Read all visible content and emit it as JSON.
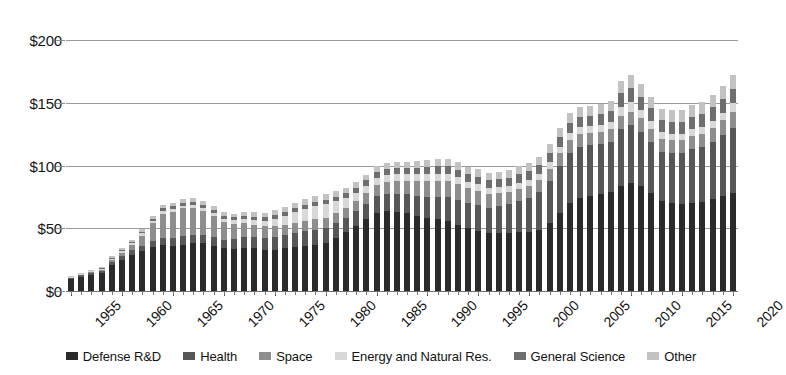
{
  "chart_data": {
    "type": "bar",
    "stacked": true,
    "title": "",
    "subtitle": "",
    "xlabel": "",
    "ylabel": "",
    "ylim": [
      0,
      200
    ],
    "y_ticks": [
      0,
      50,
      100,
      150,
      200
    ],
    "y_tick_labels": [
      "$0",
      "$50",
      "$100",
      "$150",
      "$200"
    ],
    "grid": true,
    "legend_position": "bottom",
    "x_tick_labels": [
      "1955",
      "1960",
      "1965",
      "1970",
      "1975",
      "1980",
      "1985",
      "1990",
      "1995",
      "2000",
      "2005",
      "2010",
      "2015",
      "2020"
    ],
    "categories": [
      "1955",
      "1956",
      "1957",
      "1958",
      "1959",
      "1960",
      "1961",
      "1962",
      "1963",
      "1964",
      "1965",
      "1966",
      "1967",
      "1968",
      "1969",
      "1970",
      "1971",
      "1972",
      "1973",
      "1974",
      "1975",
      "1976",
      "1977",
      "1978",
      "1979",
      "1980",
      "1981",
      "1982",
      "1983",
      "1984",
      "1985",
      "1986",
      "1987",
      "1988",
      "1989",
      "1990",
      "1991",
      "1992",
      "1993",
      "1994",
      "1995",
      "1996",
      "1997",
      "1998",
      "1999",
      "2000",
      "2001",
      "2002",
      "2003",
      "2004",
      "2005",
      "2006",
      "2007",
      "2008",
      "2009",
      "2010",
      "2011",
      "2012",
      "2013",
      "2014",
      "2015",
      "2016",
      "2017",
      "2018",
      "2019",
      "2020"
    ],
    "series": [
      {
        "name": "Defense R&D",
        "color": "#2b2b2b",
        "values": [
          9.5,
          11.5,
          13.0,
          14.5,
          21.0,
          25.0,
          29.0,
          32.0,
          35.0,
          37.0,
          36.0,
          37.0,
          38.0,
          38.0,
          36.0,
          34.0,
          33.5,
          34.0,
          34.0,
          33.0,
          33.0,
          34.0,
          35.0,
          36.0,
          37.0,
          38.0,
          42.0,
          47.0,
          52.0,
          57.0,
          62.0,
          64.0,
          63.0,
          62.0,
          60.0,
          58.0,
          57.0,
          56.0,
          53.0,
          50.0,
          48.0,
          46.0,
          46.0,
          46.0,
          47.0,
          47.0,
          49.0,
          54.0,
          62.0,
          70.0,
          74.0,
          76.0,
          77.0,
          79.0,
          84.0,
          86.0,
          84.0,
          78.0,
          72.0,
          70.0,
          69.0,
          70.0,
          71.0,
          73.0,
          76.0,
          78.0
        ]
      },
      {
        "name": "Health",
        "color": "#575757",
        "values": [
          0.8,
          1.0,
          1.3,
          1.6,
          2.2,
          2.8,
          3.5,
          4.2,
          5.0,
          5.6,
          6.2,
          6.8,
          7.0,
          7.0,
          6.8,
          7.0,
          8.0,
          9.0,
          9.0,
          9.5,
          10.0,
          10.5,
          11.0,
          11.5,
          12.0,
          12.0,
          12.0,
          11.5,
          12.0,
          12.5,
          13.5,
          13.5,
          14.5,
          15.0,
          16.0,
          17.0,
          18.0,
          19.0,
          19.5,
          20.0,
          20.5,
          20.5,
          21.5,
          23.0,
          25.0,
          27.0,
          30.0,
          34.0,
          38.0,
          40.0,
          41.0,
          40.0,
          40.0,
          40.0,
          45.0,
          46.0,
          43.0,
          41.0,
          39.0,
          40.0,
          41.0,
          43.0,
          44.0,
          46.0,
          48.0,
          52.0
        ]
      },
      {
        "name": "Space",
        "color": "#8e8e8e",
        "values": [
          0.3,
          0.4,
          0.5,
          0.7,
          1.5,
          2.5,
          4.0,
          8.0,
          14.0,
          19.0,
          21.0,
          22.0,
          21.0,
          19.0,
          17.0,
          14.0,
          12.0,
          11.0,
          10.0,
          9.0,
          8.5,
          8.5,
          8.5,
          8.5,
          8.5,
          8.5,
          8.5,
          8.0,
          8.0,
          8.5,
          9.0,
          9.5,
          10.0,
          10.5,
          11.5,
          12.5,
          13.0,
          13.0,
          12.5,
          12.0,
          11.5,
          11.0,
          10.5,
          10.0,
          9.5,
          9.5,
          9.5,
          9.5,
          10.0,
          10.5,
          10.5,
          10.0,
          10.0,
          10.0,
          10.5,
          11.0,
          11.0,
          10.5,
          10.0,
          10.0,
          10.0,
          10.5,
          10.5,
          11.0,
          12.0,
          13.0
        ]
      },
      {
        "name": "Energy and Natural Res.",
        "color": "#d8d8d8",
        "values": [
          0.6,
          0.7,
          0.8,
          0.9,
          1.2,
          1.4,
          1.6,
          1.8,
          2.0,
          2.2,
          2.2,
          2.3,
          2.4,
          2.4,
          2.4,
          2.5,
          2.8,
          3.2,
          3.6,
          4.5,
          6.0,
          7.0,
          8.5,
          9.5,
          10.0,
          10.5,
          9.0,
          7.5,
          6.5,
          6.0,
          5.8,
          5.5,
          5.5,
          5.5,
          5.5,
          5.5,
          5.5,
          5.5,
          5.5,
          5.2,
          5.0,
          4.8,
          4.8,
          4.8,
          4.8,
          4.8,
          4.8,
          5.0,
          5.0,
          5.2,
          5.2,
          5.2,
          5.2,
          5.5,
          7.5,
          7.5,
          6.5,
          6.0,
          5.5,
          5.5,
          5.5,
          5.5,
          5.5,
          5.8,
          6.0,
          6.5
        ]
      },
      {
        "name": "General Science",
        "color": "#6e6e6e",
        "values": [
          0.2,
          0.3,
          0.4,
          0.5,
          0.7,
          0.9,
          1.1,
          1.4,
          1.7,
          2.0,
          2.2,
          2.4,
          2.5,
          2.5,
          2.4,
          2.4,
          2.5,
          2.6,
          2.7,
          2.8,
          2.9,
          3.0,
          3.2,
          3.4,
          3.6,
          3.8,
          3.8,
          3.8,
          4.0,
          4.2,
          4.5,
          4.5,
          4.8,
          5.0,
          5.2,
          5.5,
          5.8,
          6.0,
          6.0,
          6.0,
          6.0,
          6.0,
          6.2,
          6.5,
          6.8,
          7.0,
          7.2,
          7.5,
          7.8,
          8.0,
          8.2,
          8.2,
          8.5,
          8.8,
          10.5,
          11.0,
          10.5,
          10.0,
          9.5,
          9.5,
          9.5,
          9.8,
          10.0,
          10.5,
          11.0,
          11.5
        ]
      },
      {
        "name": "Other",
        "color": "#c2c2c2",
        "values": [
          0.6,
          0.7,
          0.8,
          0.9,
          1.2,
          1.5,
          1.8,
          2.1,
          2.4,
          2.6,
          2.8,
          3.0,
          3.0,
          3.0,
          2.9,
          2.9,
          3.0,
          3.2,
          3.4,
          3.6,
          3.8,
          4.0,
          4.2,
          4.4,
          4.6,
          4.8,
          4.6,
          4.4,
          4.4,
          4.6,
          4.8,
          4.8,
          5.0,
          5.2,
          5.4,
          5.6,
          5.8,
          6.0,
          6.0,
          6.0,
          6.0,
          5.8,
          5.8,
          6.0,
          6.2,
          6.4,
          6.6,
          7.0,
          7.5,
          7.8,
          8.0,
          8.0,
          8.2,
          8.5,
          10.0,
          10.5,
          10.0,
          9.5,
          9.0,
          9.0,
          9.0,
          9.2,
          9.5,
          10.0,
          10.5,
          11.5
        ]
      }
    ],
    "totals": [
      12.0,
      14.6,
      16.8,
      19.1,
      27.8,
      34.1,
      41.0,
      49.5,
      60.1,
      68.4,
      70.4,
      73.5,
      74.4,
      72.4,
      67.5,
      63.8,
      61.8,
      63.0,
      62.7,
      62.4,
      64.2,
      67.0,
      70.4,
      73.3,
      75.7,
      77.6,
      79.9,
      82.2,
      86.9,
      92.8,
      99.6,
      101.8,
      102.8,
      103.2,
      103.6,
      104.1,
      105.1,
      105.5,
      102.5,
      99.2,
      97.0,
      94.1,
      94.8,
      96.3,
      99.3,
      101.7,
      107.1,
      117.0,
      130.3,
      141.5,
      146.9,
      147.4,
      148.9,
      151.8,
      167.5,
      172.0,
      165.0,
      155.0,
      145.0,
      144.0,
      144.0,
      148.0,
      150.5,
      156.3,
      163.5,
      172.5
    ]
  }
}
